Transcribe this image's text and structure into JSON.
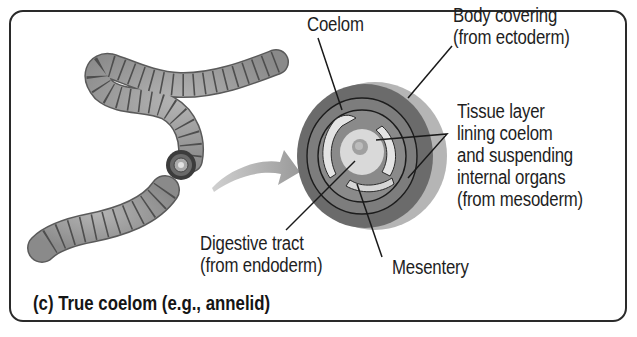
{
  "figure": {
    "caption": "(c) True coelom (e.g., annelid)",
    "labels": {
      "coelom": "Coelom",
      "body_covering": [
        "Body covering",
        "(from ectoderm)"
      ],
      "tissue_layer": [
        "Tissue layer",
        "lining coelom",
        "and suspending",
        "internal organs",
        "(from mesoderm)"
      ],
      "digestive_tract": [
        "Digestive tract",
        "(from endoderm)"
      ],
      "mesentery": "Mesentery"
    },
    "colors": {
      "worm_body": "#9a9a9a",
      "worm_segment_line": "#555555",
      "outer_ring": "#6b6b6b",
      "rim_highlight": "#b5b5b5",
      "mesoderm": "#7d7d7d",
      "coelom_space": "#e6e6e6",
      "gut": "#d8d8d8",
      "arrow": "#a9a9a9",
      "frame": "#2a2a2a"
    }
  }
}
